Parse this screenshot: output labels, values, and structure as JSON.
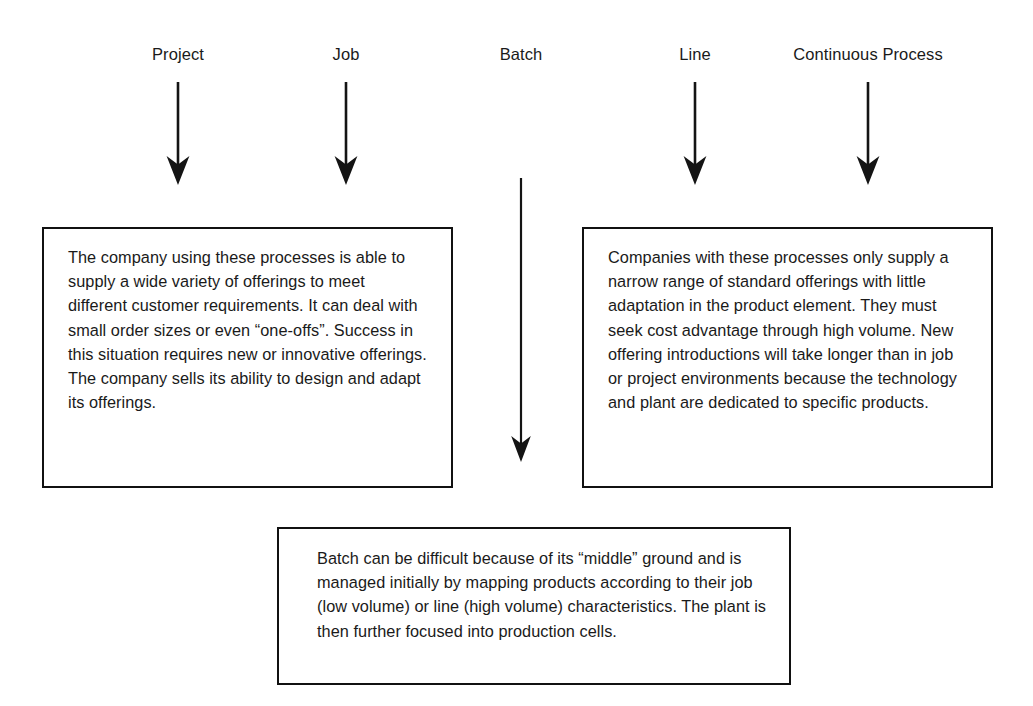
{
  "diagram": {
    "background_color": "#ffffff",
    "ink_color": "#111111",
    "headers": [
      {
        "id": "project",
        "label": "Project",
        "x": 178
      },
      {
        "id": "job",
        "label": "Job",
        "x": 346
      },
      {
        "id": "batch",
        "label": "Batch",
        "x": 521
      },
      {
        "id": "line",
        "label": "Line",
        "x": 695
      },
      {
        "id": "continuous-process",
        "label": "Continuous Process",
        "x": 868
      }
    ],
    "arrows": [
      {
        "id": "arrow-project",
        "points_to": "left-box",
        "x": 178,
        "top": 82,
        "length": 103
      },
      {
        "id": "arrow-job",
        "points_to": "left-box",
        "x": 346,
        "top": 82,
        "length": 103
      },
      {
        "id": "arrow-batch",
        "points_to": "bottom-box",
        "x": 521,
        "top": 178,
        "length": 284
      },
      {
        "id": "arrow-line",
        "points_to": "right-box",
        "x": 695,
        "top": 82,
        "length": 103
      },
      {
        "id": "arrow-continuous-process",
        "points_to": "right-box",
        "x": 868,
        "top": 82,
        "length": 103
      }
    ],
    "boxes": {
      "left": {
        "id": "left-box",
        "text": "The company using these processes is able to supply a wide variety of offerings to meet different customer requirements. It can deal with small order sizes or even “one-offs”. Success in this situation requires new or innovative offerings. The company sells its ability to design and adapt its offerings."
      },
      "right": {
        "id": "right-box",
        "text": "Companies with these processes only supply a narrow range of standard offerings with little adaptation in the product element. They must seek cost advantage through high volume. New offering introductions will take longer than in job or project environments because the technology and plant are dedicated to specific products."
      },
      "bottom": {
        "id": "bottom-box",
        "text": "Batch can be difficult because of its “middle” ground and is managed initially by mapping products according to their job (low volume) or line (high volume) characteristics. The plant is then further focused into production cells."
      }
    }
  }
}
